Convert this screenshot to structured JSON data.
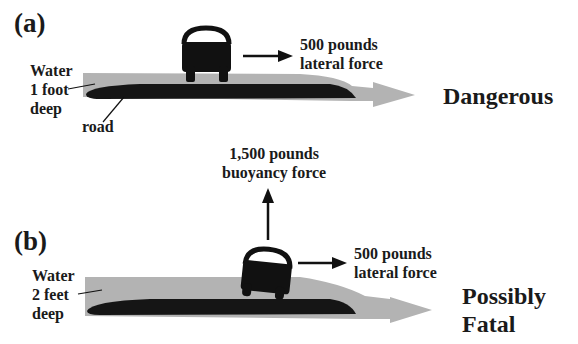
{
  "panels": [
    {
      "id": "a",
      "label": "(a)",
      "water_label": [
        "Water",
        "1 foot",
        "deep"
      ],
      "road_label": "road",
      "lateral_force_label": [
        "500 pounds",
        "lateral force"
      ],
      "verdict": [
        "Dangerous"
      ]
    },
    {
      "id": "b",
      "label": "(b)",
      "water_label": [
        "Water",
        "2 feet",
        "deep"
      ],
      "buoyancy_force_label": [
        "1,500 pounds",
        "buoyancy force"
      ],
      "lateral_force_label": [
        "500 pounds",
        "lateral force"
      ],
      "verdict": [
        "Possibly",
        "Fatal"
      ]
    }
  ],
  "colors": {
    "water": "#b3b3b3",
    "road": "#151515",
    "car": "#111111",
    "arrow": "#111111",
    "text": "#1a1a1a"
  },
  "icons": {
    "car": "car-icon",
    "lateral_arrow": "arrow-right-icon",
    "buoyancy_arrow": "arrow-up-icon",
    "flow_arrow": "flow-arrow-icon"
  }
}
